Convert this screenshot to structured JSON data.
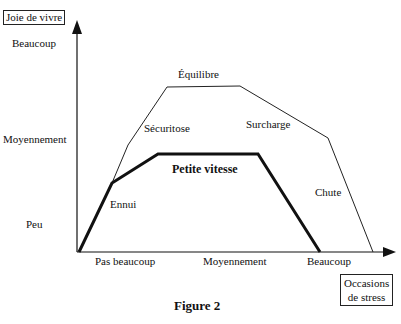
{
  "y_axis": {
    "title": "Joie de vivre",
    "levels": [
      "Beaucoup",
      "Moyennement",
      "Peu"
    ]
  },
  "x_axis": {
    "title_line1": "Occasions",
    "title_line2": "de stress",
    "levels": [
      "Pas beaucoup",
      "Moyennement",
      "Beaucoup"
    ]
  },
  "curves": {
    "outer": {
      "labels": [
        "Sécuritose",
        "Équilibre",
        "Surcharge",
        "Chute"
      ]
    },
    "inner": {
      "labels": [
        "Ennui",
        "Petite vitesse"
      ]
    }
  },
  "caption": "Figure 2"
}
